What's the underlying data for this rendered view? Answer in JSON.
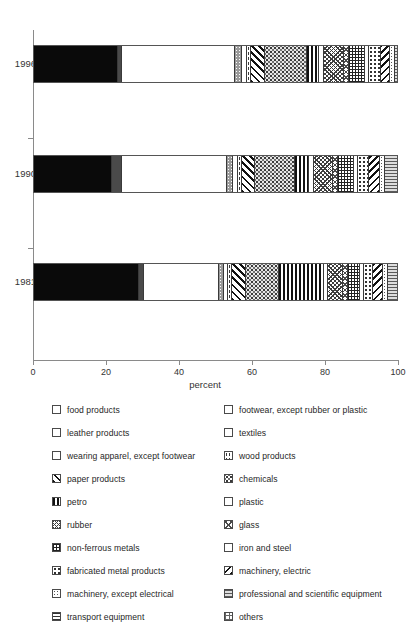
{
  "chart_data": {
    "type": "bar",
    "orientation": "horizontal",
    "stacked": true,
    "title": "",
    "xlabel": "percent",
    "ylabel": "",
    "xlim": [
      0,
      100
    ],
    "xticks": [
      0,
      20,
      40,
      60,
      80,
      100
    ],
    "xticklabels": [
      "0",
      "20",
      "40",
      "60",
      "80",
      "100"
    ],
    "categories": [
      "1996",
      "1990",
      "1981"
    ],
    "grid": false,
    "legend_position": "bottom",
    "series": [
      {
        "name": "food products",
        "key": "food",
        "values": [
          23.0,
          21.5,
          28.8
        ]
      },
      {
        "name": "leather products",
        "key": "leather",
        "values": [
          1.1,
          2.6,
          1.4
        ]
      },
      {
        "name": "wearing apparel, except footwear",
        "key": "apparel",
        "values": [
          31.1,
          28.8,
          20.5
        ]
      },
      {
        "name": "footwear, except rubber or plastic",
        "key": "footwear",
        "values": [
          1.9,
          1.6,
          1.4
        ]
      },
      {
        "name": "textiles",
        "key": "textiles",
        "values": [
          1.4,
          1.4,
          1.1
        ]
      },
      {
        "name": "wood products",
        "key": "wood",
        "values": [
          1.1,
          1.1,
          1.1
        ]
      },
      {
        "name": "paper products",
        "key": "paper",
        "values": [
          3.6,
          3.6,
          3.8
        ]
      },
      {
        "name": "chemicals",
        "key": "chemicals",
        "values": [
          11.5,
          11.0,
          9.0
        ]
      },
      {
        "name": "petro",
        "key": "petro",
        "values": [
          3.3,
          3.8,
          12.3
        ]
      },
      {
        "name": "plastic",
        "key": "plastic",
        "values": [
          1.4,
          1.4,
          1.1
        ]
      },
      {
        "name": "rubber",
        "key": "rubber",
        "values": [
          5.5,
          5.2,
          4.1
        ]
      },
      {
        "name": "glass",
        "key": "glass",
        "values": [
          1.4,
          1.4,
          1.4
        ]
      },
      {
        "name": "non-ferrous metals",
        "key": "nonferrous",
        "values": [
          4.4,
          4.4,
          3.3
        ]
      },
      {
        "name": "iron and steel",
        "key": "ironsteel",
        "values": [
          1.1,
          1.1,
          1.1
        ]
      },
      {
        "name": "fabricated metal products",
        "key": "fabmetal",
        "values": [
          3.3,
          3.0,
          2.5
        ]
      },
      {
        "name": "machinery, electric",
        "key": "machelec",
        "values": [
          2.5,
          3.0,
          2.7
        ]
      },
      {
        "name": "machinery, except electrical",
        "key": "machnonelec",
        "values": [
          1.4,
          1.4,
          1.4
        ]
      },
      {
        "name": "transport equipment",
        "key": "transport",
        "values": [
          0.0,
          0.0,
          0.0
        ]
      },
      {
        "name": "professional and scientific equipment",
        "key": "prof",
        "values": [
          4.7,
          4.4,
          3.5
        ]
      },
      {
        "name": "others",
        "key": "others",
        "values": [
          1.3,
          0.3,
          0.5
        ]
      }
    ]
  },
  "axis": {
    "x_title": "percent",
    "x_tick_labels": [
      "0",
      "20",
      "40",
      "60",
      "80",
      "100"
    ],
    "y_tick_labels": [
      "1996",
      "1990",
      "1981"
    ]
  },
  "legend": {
    "left_column": [
      {
        "label": "food products",
        "swatch": "food"
      },
      {
        "label": "leather products",
        "swatch": "leather"
      },
      {
        "label": "wearing apparel, except footwear",
        "swatch": "apparel"
      },
      {
        "label": "paper products",
        "swatch": "paper"
      },
      {
        "label": "petro",
        "swatch": "petro"
      },
      {
        "label": "rubber",
        "swatch": "rubber"
      },
      {
        "label": "non-ferrous metals",
        "swatch": "nonferrous"
      },
      {
        "label": "fabricated metal products",
        "swatch": "fabmetal"
      },
      {
        "label": "machinery, except electrical",
        "swatch": "machnonelec"
      },
      {
        "label": "transport equipment",
        "swatch": "transport"
      }
    ],
    "right_column": [
      {
        "label": "footwear, except rubber or plastic",
        "swatch": "footwear"
      },
      {
        "label": "textiles",
        "swatch": "textiles"
      },
      {
        "label": "wood products",
        "swatch": "wood"
      },
      {
        "label": "chemicals",
        "swatch": "chemicals"
      },
      {
        "label": "plastic",
        "swatch": "plastic"
      },
      {
        "label": "glass",
        "swatch": "glass"
      },
      {
        "label": "iron and steel",
        "swatch": "ironsteel"
      },
      {
        "label": "machinery, electric",
        "swatch": "machelec"
      },
      {
        "label": "professional and scientific equipment",
        "swatch": "prof"
      },
      {
        "label": "others",
        "swatch": "others"
      }
    ]
  },
  "colors": {
    "axis": "#8a8a8a",
    "outline": "#3a3a3a",
    "text": "#1f1f1f",
    "solid_black": "#0a0a0a",
    "solid_gray": "#4a4a4a"
  }
}
